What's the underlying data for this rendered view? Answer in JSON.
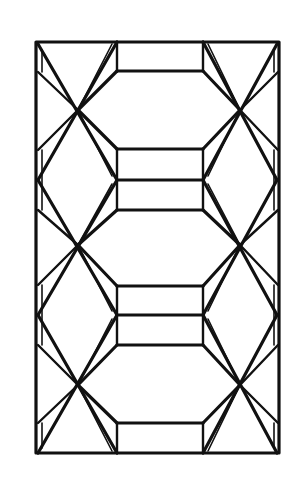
{
  "diagram": {
    "type": "line-drawing",
    "stroke_color": "#111111",
    "background_color": "#ffffff",
    "frame": {
      "x1": 36,
      "y1": 42,
      "x2": 279,
      "y2": 453
    },
    "crossing_points": [
      {
        "x": 78,
        "y": 110
      },
      {
        "x": 240,
        "y": 110
      },
      {
        "x": 78,
        "y": 245
      },
      {
        "x": 240,
        "y": 245
      },
      {
        "x": 78,
        "y": 385
      },
      {
        "x": 240,
        "y": 385
      }
    ],
    "hexagons": 3,
    "inner_rectangles": 6
  }
}
